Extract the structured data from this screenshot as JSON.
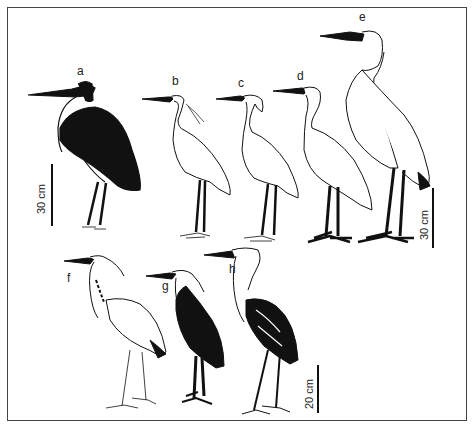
{
  "figure": {
    "labels": {
      "a": "a",
      "b": "b",
      "c": "c",
      "d": "d",
      "e": "e",
      "f": "f",
      "g": "g",
      "h": "h"
    },
    "scale_bars": {
      "left": "30 cm",
      "right": "30 cm",
      "bottom": "20 cm"
    }
  }
}
